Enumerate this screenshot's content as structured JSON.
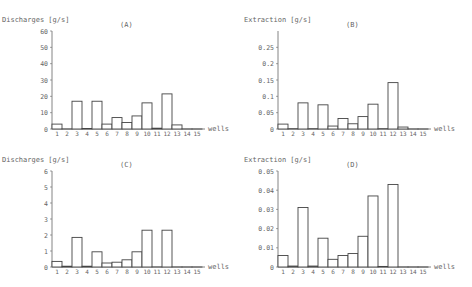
{
  "chart_data": [
    {
      "type": "bar",
      "panel": "(A)",
      "title": "(A)",
      "ylabel": "Discharges [g/s]",
      "xlabel": "wells",
      "categories": [
        "1",
        "2",
        "3",
        "4",
        "5",
        "6",
        "7",
        "8",
        "9",
        "10",
        "11",
        "12",
        "13",
        "14",
        "15"
      ],
      "values": [
        3,
        0,
        17,
        0.3,
        17,
        3,
        7,
        4,
        8,
        16,
        0.5,
        21.5,
        2.5,
        0,
        0
      ],
      "ylim": [
        0,
        60
      ],
      "yticks": [
        "0",
        "10",
        "20",
        "30",
        "40",
        "50",
        "60"
      ],
      "ytick_values": [
        0,
        10,
        20,
        30,
        40,
        50,
        60
      ],
      "grid": false
    },
    {
      "type": "bar",
      "panel": "(B)",
      "title": "(B)",
      "ylabel": "Extraction [g/s]",
      "xlabel": "wells",
      "categories": [
        "1",
        "2",
        "3",
        "4",
        "5",
        "6",
        "7",
        "8",
        "9",
        "10",
        "11",
        "12",
        "13",
        "14",
        "15"
      ],
      "values": [
        0.015,
        0.001,
        0.08,
        0.001,
        0.074,
        0.009,
        0.032,
        0.016,
        0.038,
        0.076,
        0.001,
        0.142,
        0.006,
        0,
        0
      ],
      "ylim": [
        0,
        0.3
      ],
      "yticks": [
        "0",
        "0.05",
        "0.1",
        "0.15",
        "0.2",
        "0.25"
      ],
      "ytick_values": [
        0,
        0.05,
        0.1,
        0.15,
        0.2,
        0.25
      ],
      "grid": false
    },
    {
      "type": "bar",
      "panel": "(C)",
      "title": "(C)",
      "ylabel": "Discharges [g/s]",
      "xlabel": "wells",
      "categories": [
        "1",
        "2",
        "3",
        "4",
        "5",
        "6",
        "7",
        "8",
        "9",
        "10",
        "11",
        "12",
        "13",
        "14",
        "15"
      ],
      "values": [
        0.35,
        0.05,
        1.85,
        0.05,
        0.95,
        0.25,
        0.3,
        0.45,
        0.95,
        2.3,
        0,
        2.3,
        0,
        0,
        0
      ],
      "ylim": [
        0,
        6
      ],
      "yticks": [
        "0",
        "1",
        "2",
        "3",
        "4",
        "5",
        "6"
      ],
      "ytick_values": [
        0,
        1,
        2,
        3,
        4,
        5,
        6
      ],
      "grid": false
    },
    {
      "type": "bar",
      "panel": "(D)",
      "title": "(D)",
      "ylabel": "Extraction [g/s]",
      "xlabel": "wells",
      "categories": [
        "1",
        "2",
        "3",
        "4",
        "5",
        "6",
        "7",
        "8",
        "9",
        "10",
        "11",
        "12",
        "13",
        "14",
        "15"
      ],
      "values": [
        0.006,
        0.0005,
        0.031,
        0.0005,
        0.015,
        0.004,
        0.006,
        0.007,
        0.016,
        0.037,
        0.0003,
        0.043,
        0,
        0,
        0
      ],
      "ylim": [
        0,
        0.05
      ],
      "yticks": [
        "0",
        "0.01",
        "0.02",
        "0.03",
        "0.04",
        "0.05"
      ],
      "ytick_values": [
        0,
        0.01,
        0.02,
        0.03,
        0.04,
        0.05
      ],
      "grid": false
    }
  ],
  "layout": [
    {
      "left": 0,
      "top": 0,
      "originX": 52,
      "originY": 129,
      "axisTop": 31,
      "plotW": 150
    },
    {
      "left": 236,
      "top": 0,
      "originX": 278,
      "originY": 129,
      "axisTop": 31,
      "plotW": 150
    },
    {
      "left": 0,
      "top": 140,
      "originX": 52,
      "originY": 127,
      "axisTop": 31,
      "plotW": 150
    },
    {
      "left": 236,
      "top": 140,
      "originX": 278,
      "originY": 127,
      "axisTop": 31,
      "plotW": 150
    }
  ]
}
